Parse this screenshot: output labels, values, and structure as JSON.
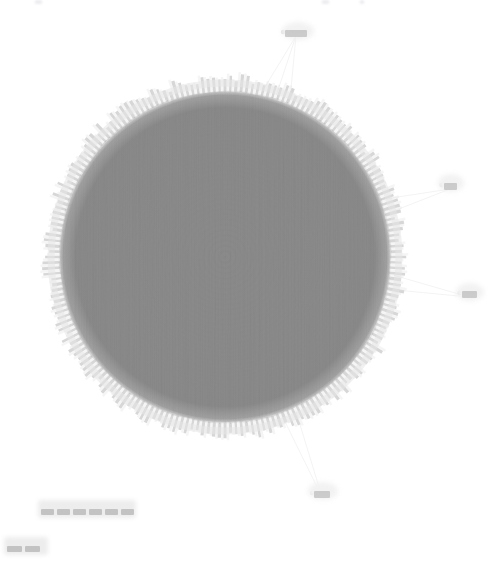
{
  "figure": {
    "title": "",
    "background_color": "#ffffff",
    "width": 495,
    "height": 562
  },
  "chart_data": {
    "type": "network-graph",
    "layout": "circular",
    "title": "",
    "colors": {
      "core_fill": "#808080",
      "node_rim": "#cfcfcf",
      "edge": "#c8c8c8",
      "outlier_edge": "#e0e0e0",
      "label_blur": "#b8b8b8",
      "background": "#ffffff"
    },
    "core_cluster": {
      "center_x": 225,
      "center_y": 257,
      "core_radius": 166,
      "rim_radius": 176,
      "node_count": 196,
      "edge_density": "near-complete",
      "fill_opacity": 0.55
    },
    "outlier_nodes": [
      {
        "id": "n-top",
        "x": 296,
        "y": 33,
        "label": "",
        "label_w": 22,
        "label_h": 7,
        "edges_to_core": 3
      },
      {
        "id": "n-right1",
        "x": 450,
        "y": 186,
        "label": "",
        "label_w": 13,
        "label_h": 7,
        "edges_to_core": 2
      },
      {
        "id": "n-right2",
        "x": 469,
        "y": 294,
        "label": "",
        "label_w": 15,
        "label_h": 7,
        "edges_to_core": 2
      },
      {
        "id": "n-bottom",
        "x": 322,
        "y": 494,
        "label": "",
        "label_w": 16,
        "label_h": 7,
        "edges_to_core": 2
      }
    ],
    "detached_label_groups": [
      {
        "id": "group-lower",
        "x": 41,
        "y": 509,
        "labels": [
          {
            "text": "",
            "w": 13,
            "h": 6
          },
          {
            "text": "",
            "w": 13,
            "h": 6
          },
          {
            "text": "",
            "w": 13,
            "h": 6
          },
          {
            "text": "",
            "w": 13,
            "h": 6
          },
          {
            "text": "",
            "w": 13,
            "h": 6
          },
          {
            "text": "",
            "w": 13,
            "h": 6
          }
        ]
      },
      {
        "id": "group-corner",
        "x": 7,
        "y": 546,
        "labels": [
          {
            "text": "",
            "w": 15,
            "h": 6
          },
          {
            "text": "",
            "w": 15,
            "h": 6
          }
        ]
      }
    ],
    "axis": {
      "visible": false,
      "grid": false,
      "xlabel": "",
      "ylabel": ""
    },
    "legend": {
      "visible": false,
      "entries": []
    }
  },
  "canvas": {
    "alt_text": "Dense circular network graph"
  }
}
